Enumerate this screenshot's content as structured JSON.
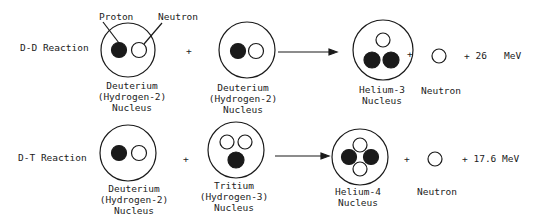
{
  "colors": {
    "ink": "#1a1a1a",
    "background": "#ffffff"
  },
  "rows": [
    {
      "reaction_label": "D-D Reaction",
      "callouts": {
        "proton": "Proton",
        "neutron": "Neutron"
      },
      "reactant1": {
        "name": "Deuterium",
        "sub": "(Hydrogen-2)",
        "kind": "Nucleus"
      },
      "plus1": "+",
      "reactant2": {
        "name": "Deuterium",
        "sub": "(Hydrogen-2)",
        "kind": "Nucleus"
      },
      "product": {
        "name": "Helium-3",
        "kind": "Nucleus"
      },
      "plus2": "+",
      "byproduct": {
        "name": "Neutron"
      },
      "energy": "+ 26   MeV"
    },
    {
      "reaction_label": "D-T Reaction",
      "reactant1": {
        "name": "Deuterium",
        "sub": "(Hydrogen-2)",
        "kind": "Nucleus"
      },
      "plus1": "+",
      "reactant2": {
        "name": "Tritium",
        "sub": "(Hydrogen-3)",
        "kind": "Nucleus"
      },
      "product": {
        "name": "Helium-4",
        "kind": "Nucleus"
      },
      "plus2": "+",
      "byproduct": {
        "name": "Neutron"
      },
      "energy": "+ 17.6 MeV"
    }
  ]
}
